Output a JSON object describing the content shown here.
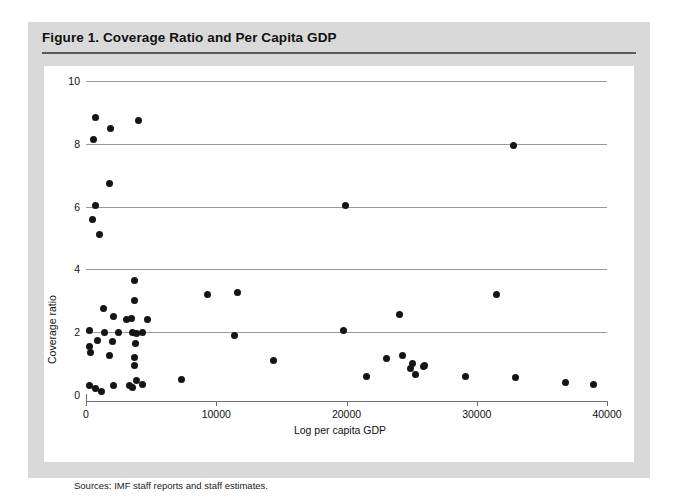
{
  "figure": {
    "title": "Figure 1. Coverage Ratio and Per Capita GDP",
    "source_note": "Sources:  IMF staff reports and staff estimates."
  },
  "colors": {
    "panel_background": "#d9d9d9",
    "plot_background": "#ffffff",
    "title_rule": "#5a5a5a",
    "gridline": "#9a9a9a",
    "axis": "#6f6f6f",
    "marker": "#151515",
    "text": "#111111"
  },
  "chart_data": {
    "type": "scatter",
    "title": "Figure 1. Coverage Ratio and Per Capita GDP",
    "xlabel": "Log per capita GDP",
    "ylabel": "Coverage ratio",
    "xlim": [
      0,
      40000
    ],
    "ylim": [
      0,
      10
    ],
    "xticks": [
      0,
      10000,
      20000,
      30000,
      40000
    ],
    "xtick_labels": [
      "0",
      "10000",
      "20000",
      "30000",
      "40000"
    ],
    "yticks": [
      0,
      2,
      4,
      6,
      8,
      10
    ],
    "ytick_labels": [
      "0",
      "2",
      "4",
      "6",
      "8",
      "10"
    ],
    "grid": "horizontal",
    "legend": null,
    "marker": "filled-circle",
    "series": [
      {
        "name": "Countries",
        "points": [
          [
            700,
            8.85
          ],
          [
            600,
            8.15
          ],
          [
            1850,
            8.5
          ],
          [
            4050,
            8.75
          ],
          [
            32800,
            7.95
          ],
          [
            1800,
            6.75
          ],
          [
            700,
            6.05
          ],
          [
            19900,
            6.05
          ],
          [
            500,
            5.6
          ],
          [
            1000,
            5.1
          ],
          [
            3700,
            3.65
          ],
          [
            9300,
            3.2
          ],
          [
            11600,
            3.25
          ],
          [
            31500,
            3.2
          ],
          [
            3700,
            3.0
          ],
          [
            24100,
            2.55
          ],
          [
            1350,
            2.75
          ],
          [
            2100,
            2.5
          ],
          [
            3500,
            2.45
          ],
          [
            3100,
            2.4
          ],
          [
            4750,
            2.4
          ],
          [
            300,
            2.05
          ],
          [
            1400,
            2.0
          ],
          [
            2500,
            1.98
          ],
          [
            3550,
            2.0
          ],
          [
            3900,
            1.95
          ],
          [
            4300,
            2.0
          ],
          [
            19800,
            2.05
          ],
          [
            900,
            1.75
          ],
          [
            2050,
            1.7
          ],
          [
            3800,
            1.65
          ],
          [
            11400,
            1.9
          ],
          [
            300,
            1.55
          ],
          [
            350,
            1.35
          ],
          [
            1800,
            1.25
          ],
          [
            3750,
            1.2
          ],
          [
            3700,
            0.95
          ],
          [
            14400,
            1.1
          ],
          [
            23100,
            1.15
          ],
          [
            24300,
            1.25
          ],
          [
            25100,
            1.0
          ],
          [
            24900,
            0.85
          ],
          [
            25900,
            0.9
          ],
          [
            26000,
            0.95
          ],
          [
            25300,
            0.65
          ],
          [
            21500,
            0.6
          ],
          [
            29100,
            0.6
          ],
          [
            33000,
            0.55
          ],
          [
            36800,
            0.4
          ],
          [
            39000,
            0.35
          ],
          [
            7300,
            0.5
          ],
          [
            3900,
            0.45
          ],
          [
            4350,
            0.35
          ],
          [
            300,
            0.3
          ],
          [
            700,
            0.22
          ],
          [
            1200,
            0.1
          ],
          [
            2100,
            0.3
          ],
          [
            3350,
            0.3
          ],
          [
            3550,
            0.25
          ]
        ]
      }
    ]
  }
}
